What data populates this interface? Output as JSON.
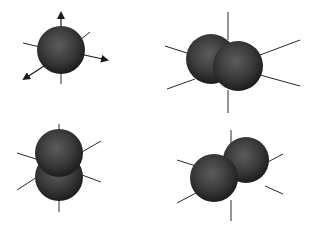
{
  "diagram": {
    "colors": {
      "background": "#ffffff",
      "sphere_dark": "#1e1e1e",
      "sphere_mid": "#3a3a3a",
      "sphere_highlight": "#5c5c5c",
      "axis": "#2a2a2a"
    },
    "panels": [
      {
        "id": "single-sphere-with-arrows",
        "spheres": 1,
        "arrows": [
          "up",
          "right",
          "down-left"
        ]
      },
      {
        "id": "two-spheres-horizontal",
        "spheres": 2,
        "arrows": []
      },
      {
        "id": "two-spheres-vertical",
        "spheres": 2,
        "arrows": []
      },
      {
        "id": "two-spheres-diagonal",
        "spheres": 2,
        "arrows": []
      }
    ]
  }
}
